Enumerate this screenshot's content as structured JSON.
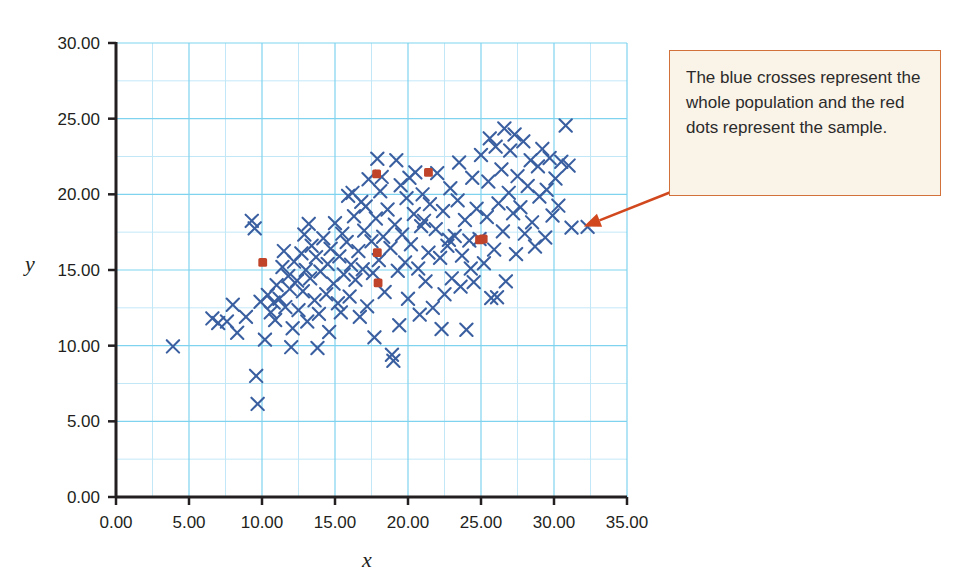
{
  "chart_data": {
    "type": "scatter",
    "title": "",
    "xlabel": "x",
    "ylabel": "y",
    "xlim": [
      0,
      35
    ],
    "ylim": [
      0,
      30
    ],
    "xticks": [
      "0.00",
      "5.00",
      "10.00",
      "15.00",
      "20.00",
      "25.00",
      "30.00",
      "35.00"
    ],
    "yticks": [
      "0.00",
      "5.00",
      "10.00",
      "15.00",
      "20.00",
      "25.00",
      "30.00"
    ],
    "xtick_values": [
      0,
      5,
      10,
      15,
      20,
      25,
      30,
      35
    ],
    "ytick_values": [
      0,
      5,
      10,
      15,
      20,
      25,
      30
    ],
    "grid": true,
    "grid_step": 2.5,
    "grid_color": "#7fd3ef",
    "minor_grid_color": "#bfe7f7",
    "legend": "none",
    "series": [
      {
        "name": "population",
        "marker": "cross",
        "color": "#3a5fa0",
        "points": [
          [
            3.9,
            9.95
          ],
          [
            6.6,
            11.8
          ],
          [
            7.0,
            11.5
          ],
          [
            7.6,
            11.6
          ],
          [
            8.0,
            12.7
          ],
          [
            8.3,
            10.85
          ],
          [
            8.9,
            11.9
          ],
          [
            9.3,
            18.25
          ],
          [
            9.5,
            17.75
          ],
          [
            9.6,
            8.0
          ],
          [
            9.7,
            6.15
          ],
          [
            9.9,
            12.9
          ],
          [
            10.2,
            10.4
          ],
          [
            10.4,
            13.35
          ],
          [
            10.6,
            12.2
          ],
          [
            10.9,
            11.7
          ],
          [
            11.0,
            14.0
          ],
          [
            11.2,
            13.1
          ],
          [
            11.4,
            15.2
          ],
          [
            11.6,
            12.55
          ],
          [
            11.8,
            14.6
          ],
          [
            11.9,
            13.75
          ],
          [
            12.0,
            9.9
          ],
          [
            12.2,
            15.55
          ],
          [
            12.4,
            14.3
          ],
          [
            12.5,
            12.35
          ],
          [
            12.7,
            16.1
          ],
          [
            12.8,
            13.6
          ],
          [
            13.0,
            15.0
          ],
          [
            13.1,
            11.6
          ],
          [
            13.3,
            14.45
          ],
          [
            13.4,
            16.6
          ],
          [
            13.6,
            13.0
          ],
          [
            13.7,
            15.85
          ],
          [
            13.9,
            12.1
          ],
          [
            14.0,
            14.9
          ],
          [
            14.2,
            17.1
          ],
          [
            14.4,
            13.4
          ],
          [
            14.5,
            15.4
          ],
          [
            14.7,
            16.4
          ],
          [
            14.9,
            14.1
          ],
          [
            15.0,
            18.1
          ],
          [
            15.2,
            12.8
          ],
          [
            15.3,
            15.9
          ],
          [
            15.5,
            17.4
          ],
          [
            15.6,
            14.7
          ],
          [
            15.8,
            16.85
          ],
          [
            16.0,
            13.25
          ],
          [
            16.1,
            15.35
          ],
          [
            16.3,
            18.55
          ],
          [
            16.4,
            14.35
          ],
          [
            16.6,
            16.25
          ],
          [
            16.8,
            19.5
          ],
          [
            16.9,
            15.05
          ],
          [
            17.0,
            17.6
          ],
          [
            17.2,
            12.6
          ],
          [
            17.3,
            21.0
          ],
          [
            17.5,
            16.9
          ],
          [
            17.6,
            14.8
          ],
          [
            17.8,
            18.4
          ],
          [
            17.9,
            22.35
          ],
          [
            18.0,
            15.65
          ],
          [
            18.1,
            20.2
          ],
          [
            18.3,
            17.2
          ],
          [
            18.4,
            13.55
          ],
          [
            18.6,
            19.0
          ],
          [
            18.8,
            16.45
          ],
          [
            18.9,
            9.4
          ],
          [
            19.0,
            9.0
          ],
          [
            19.1,
            18.0
          ],
          [
            19.3,
            14.95
          ],
          [
            19.5,
            20.6
          ],
          [
            19.6,
            17.35
          ],
          [
            19.8,
            15.5
          ],
          [
            19.9,
            19.75
          ],
          [
            20.0,
            13.1
          ],
          [
            20.2,
            16.7
          ],
          [
            20.4,
            18.7
          ],
          [
            20.5,
            21.45
          ],
          [
            20.7,
            15.1
          ],
          [
            20.9,
            17.9
          ],
          [
            21.0,
            20.0
          ],
          [
            21.2,
            14.25
          ],
          [
            21.4,
            16.15
          ],
          [
            21.5,
            19.35
          ],
          [
            21.7,
            12.5
          ],
          [
            21.9,
            17.7
          ],
          [
            22.0,
            21.4
          ],
          [
            22.2,
            15.8
          ],
          [
            22.4,
            18.9
          ],
          [
            22.5,
            13.4
          ],
          [
            22.7,
            16.6
          ],
          [
            22.9,
            20.4
          ],
          [
            23.0,
            14.45
          ],
          [
            23.2,
            17.25
          ],
          [
            23.4,
            19.6
          ],
          [
            23.5,
            22.1
          ],
          [
            23.7,
            15.95
          ],
          [
            23.9,
            18.3
          ],
          [
            24.0,
            11.05
          ],
          [
            24.2,
            16.95
          ],
          [
            24.4,
            21.1
          ],
          [
            24.5,
            14.2
          ],
          [
            24.7,
            19.05
          ],
          [
            24.9,
            17.05
          ],
          [
            25.0,
            22.6
          ],
          [
            25.2,
            15.45
          ],
          [
            25.4,
            18.5
          ],
          [
            25.5,
            20.85
          ],
          [
            25.7,
            13.15
          ],
          [
            25.9,
            16.35
          ],
          [
            26.0,
            23.15
          ],
          [
            26.2,
            19.4
          ],
          [
            26.4,
            21.65
          ],
          [
            26.5,
            17.55
          ],
          [
            26.7,
            14.25
          ],
          [
            26.9,
            20.1
          ],
          [
            27.0,
            22.9
          ],
          [
            27.2,
            18.75
          ],
          [
            27.4,
            16.05
          ],
          [
            27.5,
            21.2
          ],
          [
            27.7,
            19.15
          ],
          [
            27.9,
            23.5
          ],
          [
            28.0,
            17.4
          ],
          [
            28.2,
            20.55
          ],
          [
            28.4,
            22.25
          ],
          [
            28.5,
            18.15
          ],
          [
            28.7,
            16.55
          ],
          [
            28.9,
            21.85
          ],
          [
            29.0,
            19.85
          ],
          [
            29.2,
            23.0
          ],
          [
            29.4,
            17.15
          ],
          [
            29.5,
            20.3
          ],
          [
            29.7,
            22.4
          ],
          [
            29.9,
            18.6
          ],
          [
            30.1,
            21.05
          ],
          [
            30.3,
            19.25
          ],
          [
            30.5,
            22.15
          ],
          [
            30.8,
            24.55
          ],
          [
            31.0,
            21.9
          ],
          [
            31.2,
            17.8
          ],
          [
            32.3,
            17.85
          ],
          [
            26.6,
            24.35
          ],
          [
            27.3,
            23.95
          ],
          [
            25.6,
            23.7
          ],
          [
            19.2,
            22.25
          ],
          [
            20.1,
            21.1
          ],
          [
            18.2,
            21.15
          ],
          [
            12.9,
            17.35
          ],
          [
            11.5,
            16.25
          ],
          [
            13.2,
            18.05
          ],
          [
            15.9,
            19.9
          ],
          [
            17.1,
            19.2
          ],
          [
            16.2,
            20.1
          ],
          [
            21.1,
            18.25
          ],
          [
            22.8,
            17.0
          ],
          [
            24.3,
            15.1
          ],
          [
            23.6,
            13.9
          ],
          [
            20.8,
            12.05
          ],
          [
            19.4,
            11.35
          ],
          [
            17.7,
            10.55
          ],
          [
            16.7,
            11.9
          ],
          [
            14.6,
            10.9
          ],
          [
            13.8,
            9.85
          ],
          [
            15.4,
            12.2
          ],
          [
            12.1,
            11.15
          ],
          [
            10.8,
            12.85
          ],
          [
            22.3,
            11.1
          ],
          [
            26.1,
            13.2
          ]
        ]
      },
      {
        "name": "sample",
        "marker": "square-dot",
        "color": "#c0442a",
        "points": [
          [
            10.05,
            15.5
          ],
          [
            17.85,
            21.35
          ],
          [
            21.4,
            21.45
          ],
          [
            17.9,
            16.15
          ],
          [
            17.95,
            14.15
          ],
          [
            24.9,
            17.0
          ],
          [
            25.15,
            17.05
          ]
        ]
      }
    ]
  },
  "annotation": {
    "text": "The blue crosses represent the whole population and the red dots represent the sample.",
    "arrow_color": "#d2481e",
    "box_fill": "#faf3e8",
    "box_border": "#d2713a",
    "target_point": [
      32.3,
      17.85
    ]
  },
  "colors": {
    "population_marker": "#3a5fa0",
    "sample_marker": "#c0442a",
    "grid_major": "#7fd3ef",
    "grid_minor": "#c2e8f8",
    "axis": "#231f20",
    "text": "#231f20"
  }
}
